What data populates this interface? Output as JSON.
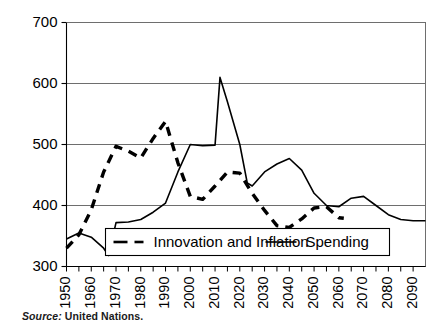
{
  "source": {
    "label": "Source:",
    "value": "United Nations."
  },
  "chart_data": {
    "type": "line",
    "title": "",
    "subtitle": "",
    "xlabel": "",
    "ylabel": "",
    "xlim": [
      1950,
      2095
    ],
    "ylim": [
      300,
      700
    ],
    "yticks": [
      300,
      400,
      500,
      600,
      700
    ],
    "ytick_labels": [
      "300",
      "400",
      "500",
      "600",
      "700"
    ],
    "xticks": [
      1950,
      1955,
      1960,
      1965,
      1970,
      1975,
      1980,
      1985,
      1990,
      1995,
      2000,
      2005,
      2010,
      2015,
      2020,
      2025,
      2030,
      2035,
      2040,
      2045,
      2050,
      2055,
      2060,
      2065,
      2070,
      2075,
      2080,
      2085,
      2090
    ],
    "xtick_labels_shown": [
      "1950",
      "1960",
      "1970",
      "1980",
      "1990",
      "2000",
      "2010",
      "2020",
      "2030",
      "2040",
      "2050",
      "2060",
      "2070",
      "2080",
      "2090"
    ],
    "xtick_label_values": [
      1950,
      1960,
      1970,
      1980,
      1990,
      2000,
      2010,
      2020,
      2030,
      2040,
      2050,
      2060,
      2070,
      2080,
      2090
    ],
    "grid": "horizontal",
    "legend_position": "bottom-inside",
    "series": [
      {
        "name": "Innovation and Inflation",
        "style": "dashed",
        "color": "#000000",
        "x": [
          1950,
          1955,
          1960,
          1965,
          1970,
          1975,
          1980,
          1985,
          1990,
          1995,
          2000,
          2005,
          2010,
          2015,
          2020,
          2025,
          2030,
          2035,
          2040,
          2045,
          2050,
          2055,
          2060,
          2062
        ],
        "values": [
          330,
          352,
          393,
          455,
          497,
          489,
          478,
          510,
          538,
          470,
          415,
          410,
          432,
          455,
          453,
          420,
          392,
          367,
          364,
          378,
          396,
          398,
          380,
          379
        ]
      },
      {
        "name": "Spending",
        "style": "solid",
        "color": "#000000",
        "x": [
          1950,
          1955,
          1960,
          1965,
          1967,
          1970,
          1975,
          1980,
          1985,
          1990,
          1995,
          2000,
          2005,
          2010,
          2012,
          2015,
          2020,
          2023,
          2025,
          2030,
          2035,
          2040,
          2045,
          2050,
          2055,
          2060,
          2065,
          2070,
          2075,
          2080,
          2085,
          2090,
          2095
        ],
        "values": [
          345,
          355,
          348,
          330,
          318,
          372,
          373,
          377,
          389,
          404,
          455,
          500,
          498,
          499,
          610,
          570,
          500,
          437,
          432,
          455,
          468,
          477,
          458,
          420,
          400,
          398,
          412,
          415,
          400,
          385,
          377,
          375,
          375
        ]
      }
    ]
  }
}
